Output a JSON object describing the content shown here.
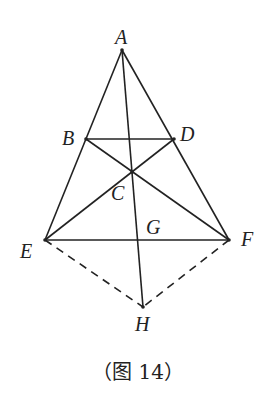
{
  "diagram": {
    "points": {
      "A": {
        "label": "A",
        "x": 122,
        "y": 50
      },
      "B": {
        "label": "B",
        "x": 86,
        "y": 139
      },
      "D": {
        "label": "D",
        "x": 174,
        "y": 139
      },
      "C": {
        "label": "C",
        "x": 132,
        "y": 172
      },
      "E": {
        "label": "E",
        "x": 45,
        "y": 240
      },
      "F": {
        "label": "F",
        "x": 229,
        "y": 240
      },
      "G": {
        "label": "G",
        "x": 138,
        "y": 240
      },
      "H": {
        "label": "H",
        "x": 143,
        "y": 307
      }
    },
    "solid_segments": [
      "AE",
      "AF",
      "BD",
      "BF",
      "DE",
      "EF",
      "AH"
    ],
    "dashed_segments": [
      "EH",
      "FH"
    ],
    "caption": "（图 14）",
    "stroke_color": "#222222"
  }
}
